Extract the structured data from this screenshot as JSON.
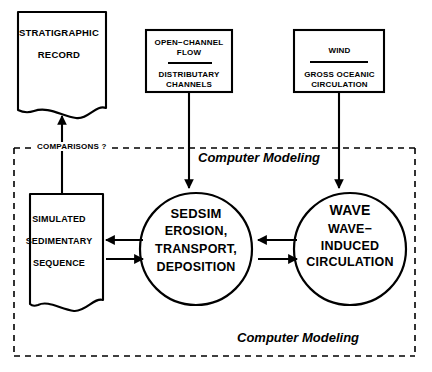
{
  "diagram": {
    "nodes": {
      "stratigraphic_record": {
        "label": "STRATIGRAPHIC\nRECORD",
        "shape": "torn-paper-box"
      },
      "open_channel_flow": {
        "label": "OPEN−CHANNEL\nFLOW",
        "shape": "rectangle"
      },
      "distributary_channels": {
        "label": "DISTRIBUTARY\nCHANNELS",
        "shape": "rectangle"
      },
      "wind": {
        "label": "WIND",
        "shape": "rectangle"
      },
      "gross_oceanic_circulation": {
        "label": "GROSS OCEANIC\nCIRCULATION",
        "shape": "rectangle"
      },
      "simulated_sequence": {
        "label": "SIMULATED\nSEDIMENTARY\nSEQUENCE",
        "shape": "torn-paper-box"
      },
      "sedsim": {
        "title": "SEDSIM",
        "body": "EROSION,\nTRANSPORT,\nDEPOSITION",
        "shape": "circle"
      },
      "wave": {
        "title": "WAVE",
        "body": "WAVE−\nINDUCED\nCIRCULATION",
        "shape": "circle"
      }
    },
    "annotations": {
      "comparisons": "COMPARISONS ?",
      "computer_modeling_top": "Computer Modeling",
      "computer_modeling_bottom": "Computer Modeling"
    },
    "colors": {
      "stroke": "#000000",
      "background": "#ffffff",
      "text": "#000000"
    }
  }
}
